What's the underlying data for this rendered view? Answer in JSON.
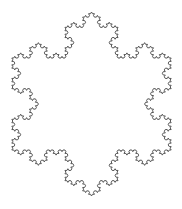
{
  "figure": {
    "stroke_color": "#555555",
    "background": "#ffffff",
    "iterations": 4,
    "center": [
      91.5,
      104
    ],
    "tip_radius": 92,
    "orientation": "point-up"
  }
}
